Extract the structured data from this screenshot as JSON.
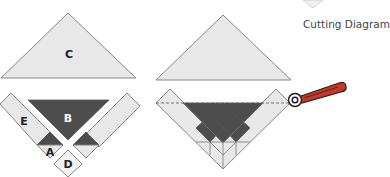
{
  "caption": "Cutting Diagram",
  "colors": {
    "light": "#e8e8e8",
    "dark": "#4d4d4d",
    "stroke": "#7a7a7a",
    "label_dark": "#222222",
    "label_light": "#ffffff"
  },
  "left_diagram": {
    "labels": {
      "C": "C",
      "B": "B",
      "E": "E",
      "A": "A",
      "D": "D"
    }
  },
  "right_diagram": {
    "cut_line": "dashed",
    "tool": "rotary-cutter"
  }
}
